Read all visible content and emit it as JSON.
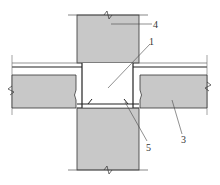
{
  "diagram": {
    "type": "structural-joint-section",
    "colors": {
      "concrete": "#c8c8c8",
      "line": "#222222",
      "background": "#ffffff"
    },
    "labels": [
      {
        "id": "label-1",
        "text": "1",
        "x": 150,
        "y": 45
      },
      {
        "id": "label-3",
        "text": "3",
        "x": 182,
        "y": 143
      },
      {
        "id": "label-4",
        "text": "4",
        "x": 155,
        "y": 28
      },
      {
        "id": "label-5",
        "text": "5",
        "x": 147,
        "y": 150
      }
    ]
  }
}
